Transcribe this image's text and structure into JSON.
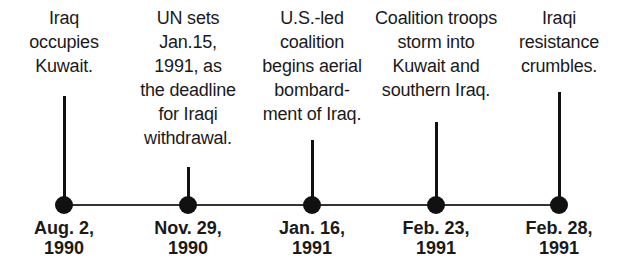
{
  "timeline": {
    "events": [
      {
        "description": [
          "Iraq",
          "occupies",
          "Kuwait."
        ],
        "date_line1": "Aug. 2,",
        "date_line2": "1990"
      },
      {
        "description": [
          "UN sets",
          "Jan.15,",
          "1991, as",
          "the deadline",
          "for Iraqi",
          "withdrawal."
        ],
        "date_line1": "Nov. 29,",
        "date_line2": "1990"
      },
      {
        "description": [
          "U.S.-led",
          "coalition",
          "begins aerial",
          "bombard-",
          "ment of Iraq."
        ],
        "date_line1": "Jan. 16,",
        "date_line2": "1991"
      },
      {
        "description": [
          "Coalition troops",
          "storm into",
          "Kuwait and",
          "southern Iraq."
        ],
        "date_line1": "Feb. 23,",
        "date_line2": "1991"
      },
      {
        "description": [
          "Iraqi",
          "resistance",
          "crumbles."
        ],
        "date_line1": "Feb. 28,",
        "date_line2": "1991"
      }
    ]
  },
  "colors": {
    "line": "#333333",
    "dot": "#111111",
    "text": "#1a1a1a"
  }
}
